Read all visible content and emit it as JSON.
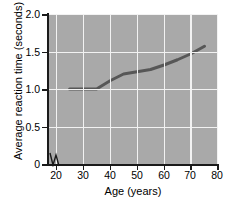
{
  "chart_data": {
    "type": "line",
    "title": "",
    "xlabel": "Age (years)",
    "ylabel": "Average reaction time (seconds)",
    "xlim": [
      17,
      80
    ],
    "ylim": [
      0,
      2.0
    ],
    "xticks": [
      20,
      30,
      40,
      50,
      60,
      70,
      80
    ],
    "xtick_labels": [
      "20",
      "30",
      "40",
      "50",
      "60",
      "70",
      "80"
    ],
    "yticks": [
      0,
      0.5,
      1.0,
      1.5,
      2.0
    ],
    "ytick_labels": [
      "0",
      "0.5",
      "1.0",
      "1.5",
      "2.0"
    ],
    "grid": true,
    "grid_color": "#f2f2f2",
    "panel_background": "#a9a9a9",
    "legend": null,
    "axis_break": {
      "axis": "x",
      "symbol": "zigzag",
      "near_value": 18
    },
    "series": [
      {
        "name": "Average reaction time",
        "color": "#575757",
        "line_width": 3,
        "x": [
          25,
          30,
          35,
          40,
          45,
          50,
          55,
          60,
          65,
          70,
          75
        ],
        "y": [
          1.0,
          1.0,
          1.0,
          1.11,
          1.2,
          1.23,
          1.26,
          1.32,
          1.39,
          1.47,
          1.57
        ]
      }
    ]
  }
}
